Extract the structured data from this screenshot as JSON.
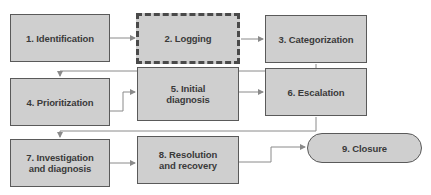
{
  "diagram": {
    "type": "flowchart",
    "title": "",
    "colors": {
      "node_fill": "#cfcfcf",
      "node_border": "#5a5a5a",
      "connector": "#8a8a8a",
      "text": "#3a3a3a"
    },
    "nodes": [
      {
        "id": "1",
        "label": "1. Identification",
        "shape": "rectangle",
        "border": "solid"
      },
      {
        "id": "2",
        "label": "2. Logging",
        "shape": "rectangle",
        "border": "dashed"
      },
      {
        "id": "3",
        "label": "3. Categorization",
        "shape": "rectangle",
        "border": "solid"
      },
      {
        "id": "4",
        "label": "4. Prioritization",
        "shape": "rectangle",
        "border": "solid"
      },
      {
        "id": "5",
        "label": "5. Initial\ndiagnosis",
        "shape": "rectangle",
        "border": "solid"
      },
      {
        "id": "6",
        "label": "6. Escalation",
        "shape": "rectangle",
        "border": "solid"
      },
      {
        "id": "7",
        "label": "7. Investigation\nand diagnosis",
        "shape": "rectangle",
        "border": "solid"
      },
      {
        "id": "8",
        "label": "8. Resolution\nand recovery",
        "shape": "rectangle",
        "border": "solid"
      },
      {
        "id": "9",
        "label": "9. Closure",
        "shape": "rounded-pill",
        "border": "solid"
      }
    ],
    "edges": [
      {
        "from": "1",
        "to": "2"
      },
      {
        "from": "2",
        "to": "3"
      },
      {
        "from": "3",
        "to": "4"
      },
      {
        "from": "4",
        "to": "5"
      },
      {
        "from": "5",
        "to": "6"
      },
      {
        "from": "6",
        "to": "7"
      },
      {
        "from": "7",
        "to": "8"
      },
      {
        "from": "8",
        "to": "9"
      }
    ]
  }
}
